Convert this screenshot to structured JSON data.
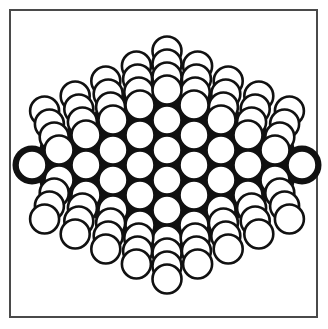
{
  "figure": {
    "colors": {
      "background": "#ffffff",
      "frame": "#4a4a4a",
      "outline": "#111111",
      "core_fill": "#111111",
      "ball_fill": "#ffffff"
    },
    "frame": {
      "x": 9,
      "y": 9,
      "width": 309,
      "height": 309
    },
    "grid": {
      "origin_x": 32,
      "center_y": 165,
      "col_step": 27,
      "row_step": 30,
      "columns": 11,
      "radius": 14.5
    },
    "layers": {
      "top": 3,
      "bottom": 3,
      "layer_step": 13
    }
  }
}
